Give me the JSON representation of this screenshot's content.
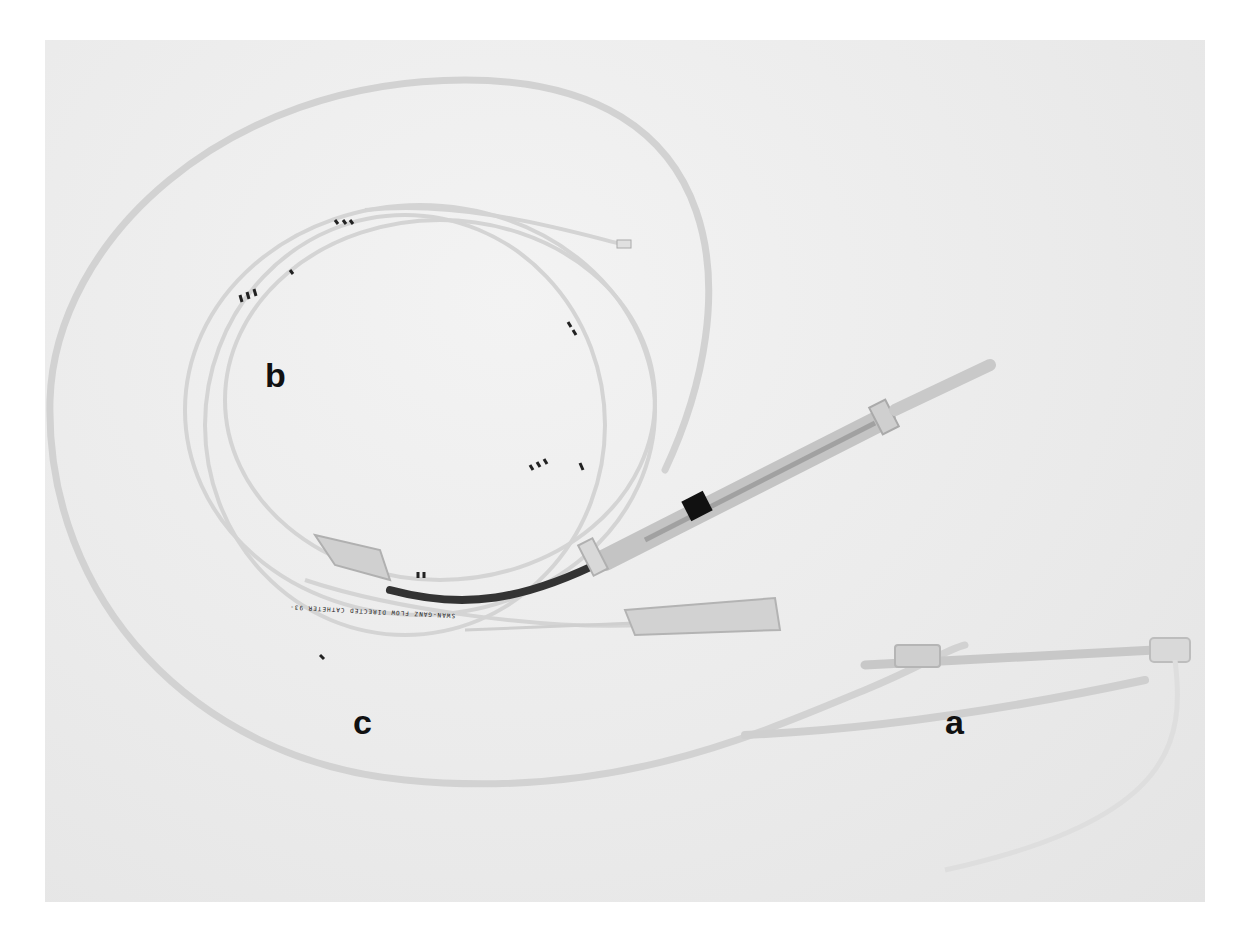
{
  "figure": {
    "labels": {
      "a": "a",
      "b": "b",
      "c": "c"
    },
    "catheter_print": "SWAN-GANZ FLOW DIRECTED CATHETER 93-",
    "colors": {
      "background": "#ebebeb",
      "page": "#ffffff",
      "tubing": "#d6d6d6",
      "dark_segment": "#333333",
      "label": "#111111"
    }
  }
}
